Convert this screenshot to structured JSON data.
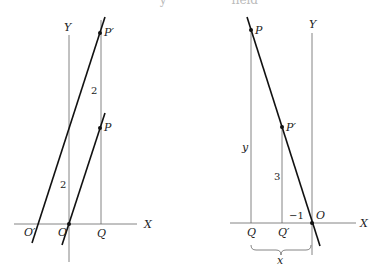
{
  "header": {
    "text": "· · · · · · y · · · · · · · · field"
  },
  "left_diagram": {
    "axis_x_label": "X",
    "axis_y_label": "Y",
    "origin_label": "O",
    "origin_prime_label": "O′",
    "q_label": "Q",
    "p_label": "P",
    "p_prime_label": "P′",
    "shift_upper_label": "2",
    "shift_lower_label": "2"
  },
  "right_diagram": {
    "axis_x_label": "X",
    "axis_y_label": "Y",
    "origin_label": "O",
    "q_label": "Q",
    "q_prime_label": "Q′",
    "p_label": "P",
    "p_prime_label": "P′",
    "y_length_label": "y",
    "three_label": "3",
    "minus_one_label": "−1",
    "x_brace_label": "x"
  }
}
